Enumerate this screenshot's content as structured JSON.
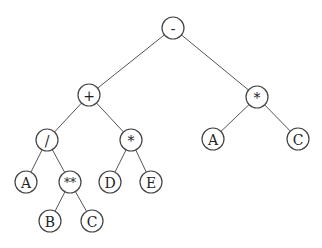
{
  "diagram": {
    "type": "expression-tree",
    "nodes": [
      {
        "id": "n0",
        "label": "-",
        "x": 173,
        "y": 28
      },
      {
        "id": "n1",
        "label": "+",
        "x": 89,
        "y": 95
      },
      {
        "id": "n2",
        "label": "*",
        "x": 257,
        "y": 97
      },
      {
        "id": "n3",
        "label": "/",
        "x": 47,
        "y": 140
      },
      {
        "id": "n4",
        "label": "*",
        "x": 131,
        "y": 140
      },
      {
        "id": "n5",
        "label": "A",
        "x": 213,
        "y": 139
      },
      {
        "id": "n6",
        "label": "C",
        "x": 298,
        "y": 139
      },
      {
        "id": "n7",
        "label": "A",
        "x": 26,
        "y": 182
      },
      {
        "id": "n8",
        "label": "**",
        "x": 70,
        "y": 182
      },
      {
        "id": "n9",
        "label": "D",
        "x": 110,
        "y": 182
      },
      {
        "id": "n10",
        "label": "E",
        "x": 151,
        "y": 182
      },
      {
        "id": "n11",
        "label": "B",
        "x": 50,
        "y": 221
      },
      {
        "id": "n12",
        "label": "C",
        "x": 92,
        "y": 221
      }
    ],
    "edges": [
      [
        "n0",
        "n1"
      ],
      [
        "n0",
        "n2"
      ],
      [
        "n1",
        "n3"
      ],
      [
        "n1",
        "n4"
      ],
      [
        "n2",
        "n5"
      ],
      [
        "n2",
        "n6"
      ],
      [
        "n3",
        "n7"
      ],
      [
        "n3",
        "n8"
      ],
      [
        "n4",
        "n9"
      ],
      [
        "n4",
        "n10"
      ],
      [
        "n8",
        "n11"
      ],
      [
        "n8",
        "n12"
      ]
    ],
    "node_radius": 11
  }
}
